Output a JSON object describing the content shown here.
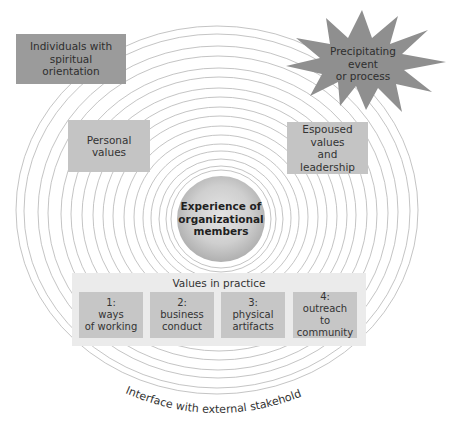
{
  "diagram": {
    "type": "concentric-circle model",
    "colors": {
      "dark_box": "#9b9b9b",
      "light_box": "#c4c4c4",
      "ring_stroke": "#b5b5b5",
      "starburst": "#8f8f8f",
      "container": "#ebebeb"
    },
    "outer_boxes": {
      "individuals": "Individuals with\nspiritual\norientation",
      "precipitating": "Precipitating\nevent\nor process",
      "personal_values": "Personal\nvalues",
      "espoused_values": "Espoused values\nand\nleadership"
    },
    "center": {
      "label": "Experience of\norganizational\nmembers"
    },
    "values_in_practice": {
      "title": "Values in practice",
      "items": [
        {
          "label": "1:\nways\nof working"
        },
        {
          "label": "2:\nbusiness\nconduct"
        },
        {
          "label": "3:\nphysical\nartifacts"
        },
        {
          "label": "4:\noutreach\nto community"
        }
      ]
    },
    "outer_caption": "Interface with external stakeholders"
  }
}
